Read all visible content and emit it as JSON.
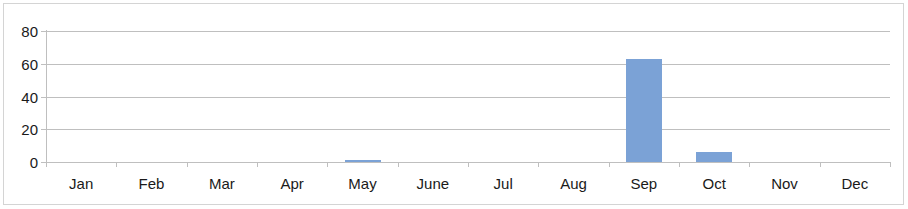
{
  "chart_data": {
    "type": "bar",
    "title": "",
    "subtitle": "",
    "xlabel": "",
    "ylabel": "",
    "categories": [
      "Jan",
      "Feb",
      "Mar",
      "Apr",
      "May",
      "June",
      "Jul",
      "Aug",
      "Sep",
      "Oct",
      "Nov",
      "Dec"
    ],
    "values": [
      0,
      0,
      0,
      0,
      1,
      0,
      0,
      0,
      63,
      6,
      0,
      0
    ],
    "ylim": [
      0,
      80
    ],
    "yticks": [
      0,
      20,
      40,
      60,
      80
    ],
    "ytick_labels": [
      "0",
      "20",
      "40",
      "60",
      "80"
    ],
    "grid": true,
    "grid_axis": "y",
    "legend": false,
    "legend_position": "none",
    "series": [
      {
        "name": "",
        "color": "#7ba2d6",
        "values": [
          0,
          0,
          0,
          0,
          1,
          0,
          0,
          0,
          63,
          6,
          0,
          0
        ]
      }
    ],
    "annotations": [],
    "colors": {
      "bar": "#7ba2d6",
      "gridline": "#bfbfbf",
      "axis": "#bfbfbf",
      "text": "#1a1a1a",
      "background": "#ffffff",
      "border": "#d4d4d4"
    }
  }
}
